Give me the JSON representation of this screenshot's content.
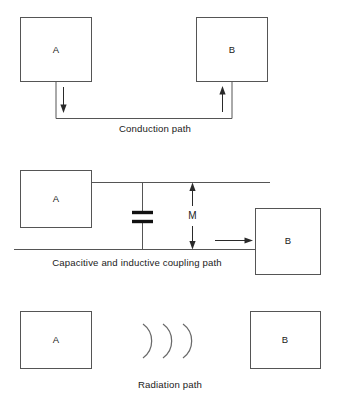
{
  "diagram": {
    "colors": {
      "box_stroke": "#555555",
      "wire": "#555555",
      "arrow": "#2a2a2a",
      "capacitor": "#111111",
      "arc": "#6a6a6a",
      "text": "#1a1a1a",
      "background": "#ffffff",
      "footer_text": "#c9c9c9"
    },
    "sections": [
      {
        "id": "conduction",
        "caption": "Conduction path",
        "blocks": [
          {
            "label": "A",
            "role": "source"
          },
          {
            "label": "B",
            "role": "victim"
          }
        ],
        "arrows": [
          {
            "name": "downward-current-arrow",
            "direction": "down"
          },
          {
            "name": "upward-current-arrow",
            "direction": "up"
          }
        ]
      },
      {
        "id": "capacitive-inductive",
        "caption": "Capacitive and inductive coupling path",
        "blocks": [
          {
            "label": "A",
            "role": "source"
          },
          {
            "label": "B",
            "role": "victim"
          }
        ],
        "components": [
          {
            "name": "coupling-capacitor",
            "symbol": "capacitor",
            "label": ""
          },
          {
            "name": "mutual-inductance-measure",
            "symbol": "double-arrow",
            "label": "M"
          }
        ],
        "arrows": [
          {
            "name": "coupled-current-arrow",
            "direction": "right"
          }
        ]
      },
      {
        "id": "radiation",
        "caption": "Radiation path",
        "blocks": [
          {
            "label": "A",
            "role": "source"
          },
          {
            "label": "B",
            "role": "victim"
          }
        ],
        "components": [
          {
            "name": "radiation-waves",
            "symbol": "three-arcs",
            "count": 3
          }
        ]
      }
    ],
    "footer_note": ""
  }
}
